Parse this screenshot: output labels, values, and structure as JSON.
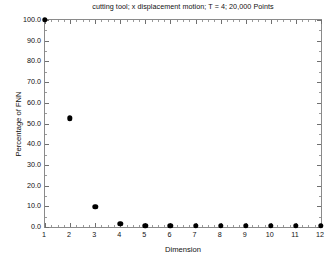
{
  "chart_data": {
    "type": "scatter",
    "title": "cutting tool; x displacement motion; T = 4; 20,000 Points",
    "xlabel": "Dimension",
    "ylabel": "Percentage of FNN",
    "xlim": [
      1,
      12
    ],
    "ylim": [
      0,
      100
    ],
    "grid": false,
    "legend": null,
    "marker": "filled-circle",
    "marker_color": "#000000",
    "x": [
      1,
      2,
      3,
      4,
      5,
      6,
      7,
      8,
      9,
      10,
      11,
      12
    ],
    "values": [
      100.0,
      52.5,
      9.8,
      1.5,
      0.6,
      0.5,
      0.5,
      0.5,
      0.5,
      0.5,
      0.5,
      0.5
    ],
    "categories": [
      "1",
      "2",
      "3",
      "4",
      "5",
      "6",
      "7",
      "8",
      "9",
      "10",
      "11",
      "12"
    ],
    "xticks": [
      1,
      2,
      3,
      4,
      5,
      6,
      7,
      8,
      9,
      10,
      11,
      12
    ],
    "xtick_labels": [
      "1",
      "2",
      "3",
      "4",
      "5",
      "6",
      "7",
      "8",
      "9",
      "10",
      "11",
      "12"
    ],
    "yticks": [
      0,
      10,
      20,
      30,
      40,
      50,
      60,
      70,
      80,
      90,
      100
    ],
    "ytick_labels": [
      "0.0",
      "10.0",
      "20.0",
      "30.0",
      "40.0",
      "50.0",
      "60.0",
      "70.0",
      "80.0",
      "90.0",
      "100.0"
    ],
    "xtick_minor_per_interval": 4,
    "ytick_minor_per_interval": 2,
    "frame_color": "#8a8a8a",
    "background": "#ffffff"
  }
}
